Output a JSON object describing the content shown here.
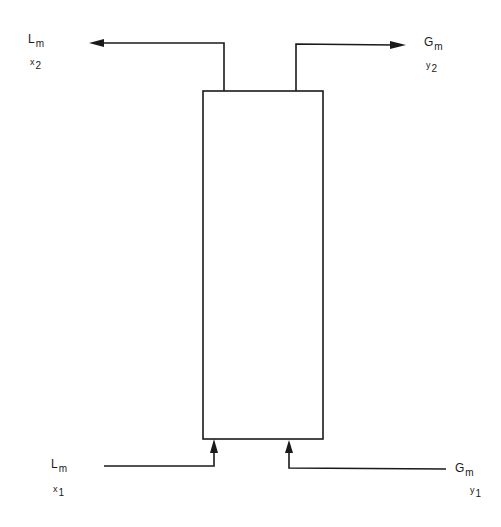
{
  "diagram": {
    "type": "countercurrent absorption column",
    "column": {
      "label": ""
    },
    "streams": {
      "liquid_out": {
        "symbol": "L",
        "subscript": "m",
        "comp_symbol": "x",
        "comp_subscript": "2"
      },
      "gas_out": {
        "symbol": "G",
        "subscript": "m",
        "comp_symbol": "y",
        "comp_subscript": "2"
      },
      "liquid_in": {
        "symbol": "L",
        "subscript": "m",
        "comp_symbol": "x",
        "comp_subscript": "1"
      },
      "gas_in": {
        "symbol": "G",
        "subscript": "m",
        "comp_symbol": "y",
        "comp_subscript": "1"
      }
    },
    "colors": {
      "line": "#1a1a1a",
      "background": "#ffffff"
    }
  }
}
